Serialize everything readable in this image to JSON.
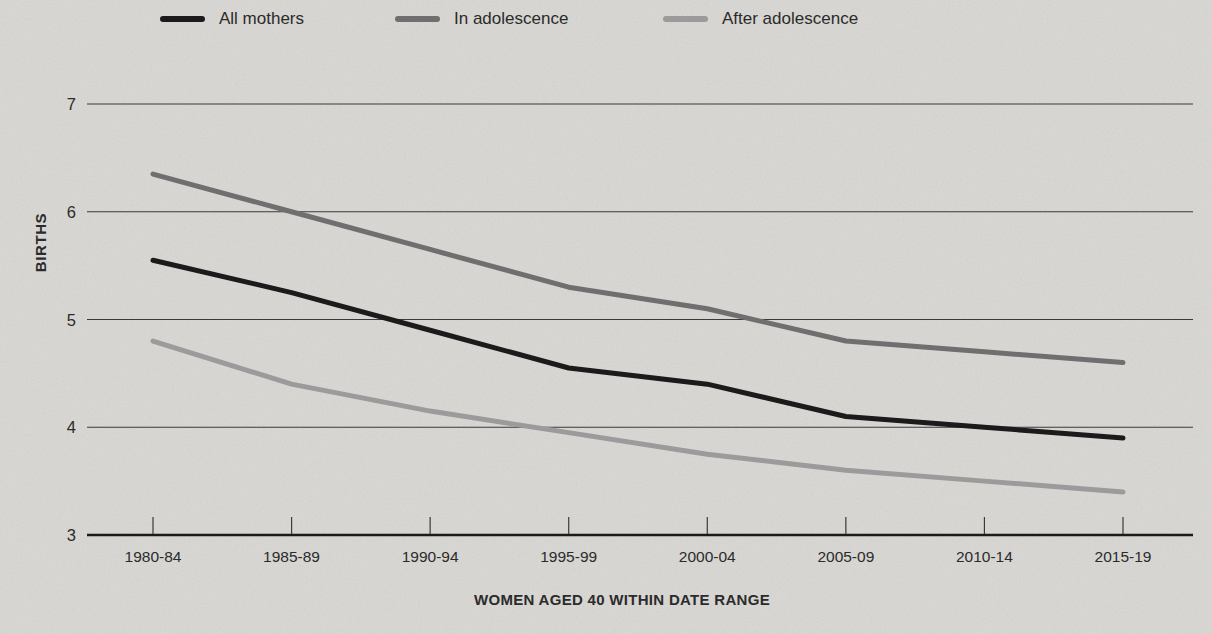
{
  "colors": {
    "background": "#d8d7d3",
    "grid": "#3a3a3a",
    "axis": "#1b1b1b",
    "text": "#2b2b2b"
  },
  "chart_data": {
    "type": "line",
    "title": "",
    "xlabel": "WOMEN AGED 40 WITHIN DATE RANGE",
    "ylabel": "BIRTHS",
    "categories": [
      "1980-84",
      "1985-89",
      "1990-94",
      "1995-99",
      "2000-04",
      "2005-09",
      "2010-14",
      "2015-19"
    ],
    "series": [
      {
        "name": "All mothers",
        "color": "#1b1b1b",
        "values": [
          5.55,
          5.25,
          4.9,
          4.55,
          4.4,
          4.1,
          4.0,
          3.9
        ]
      },
      {
        "name": "In adolescence",
        "color": "#6f6f6f",
        "values": [
          6.35,
          6.0,
          5.65,
          5.3,
          5.1,
          4.8,
          4.7,
          4.6
        ]
      },
      {
        "name": "After adolescence",
        "color": "#9b9b9b",
        "values": [
          4.8,
          4.4,
          4.15,
          3.95,
          3.75,
          3.6,
          3.5,
          3.4
        ]
      }
    ],
    "ylim": [
      3,
      7
    ],
    "yticks": [
      3,
      4,
      5,
      6,
      7
    ],
    "grid": "horizontal",
    "legend_position": "top"
  }
}
